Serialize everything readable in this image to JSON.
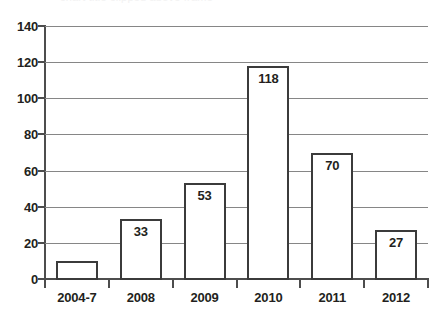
{
  "chart_data": {
    "type": "bar",
    "title": "",
    "xlabel": "",
    "ylabel": "",
    "categories": [
      "2004-7",
      "2008",
      "2009",
      "2010",
      "2011",
      "2012"
    ],
    "values": [
      10,
      33,
      53,
      118,
      70,
      27
    ],
    "value_labels": [
      "",
      "33",
      "53",
      "118",
      "70",
      "27"
    ],
    "ylim": [
      0,
      140
    ],
    "ytick_step": 20,
    "yticks": [
      0,
      20,
      40,
      60,
      80,
      100,
      120,
      140
    ],
    "ytick_labels": [
      "0",
      "20",
      "40",
      "60",
      "80",
      "100",
      "120",
      "140"
    ],
    "grid": true,
    "grid_axis": "y",
    "legend": false,
    "legend_position": "none",
    "bar_fill_color": "#ffffff",
    "bar_edge_color": "#3b3b3b",
    "gridline_color": "#868686",
    "axis_color": "#4d4d4d",
    "text_color": "#231f20"
  },
  "artifact": {
    "top_clipped_text": "chart title clipped above frame"
  }
}
